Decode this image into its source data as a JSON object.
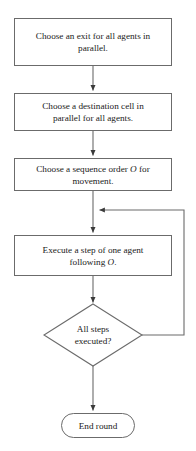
{
  "diagram": {
    "type": "flowchart",
    "colors": {
      "stroke": "#6b6b6b",
      "arrow": "#3a3a3a",
      "text": "#1a1a1a",
      "background": "#ffffff"
    },
    "nodes": [
      {
        "id": "choose-exit",
        "shape": "process",
        "line1": "Choose an exit for all agents in",
        "line2": "parallel."
      },
      {
        "id": "choose-destination",
        "shape": "process",
        "line1": "Choose a destination cell in",
        "line2": "parallel for all agents."
      },
      {
        "id": "choose-order",
        "shape": "process",
        "line1_pre": "Choose a sequence order ",
        "line1_var": "O",
        "line1_post": " for",
        "line2": "movement."
      },
      {
        "id": "execute-step",
        "shape": "process",
        "line1": "Execute a step of one agent",
        "line2_pre": "following ",
        "line2_var": "O",
        "line2_post": "."
      },
      {
        "id": "all-steps-executed",
        "shape": "decision",
        "line1": "All steps",
        "line2": "executed?"
      },
      {
        "id": "end-round",
        "shape": "terminal",
        "line1": "End round"
      }
    ],
    "edges": [
      {
        "id": "edge-exit-to-destination",
        "from": "choose-exit",
        "to": "choose-destination",
        "label": ""
      },
      {
        "id": "edge-destination-to-order",
        "from": "choose-destination",
        "to": "choose-order",
        "label": ""
      },
      {
        "id": "edge-order-to-execute",
        "from": "choose-order",
        "to": "execute-step",
        "label": ""
      },
      {
        "id": "edge-execute-to-decision",
        "from": "execute-step",
        "to": "all-steps-executed",
        "label": ""
      },
      {
        "id": "edge-decision-loopback",
        "from": "all-steps-executed",
        "to": "execute-step",
        "label": ""
      },
      {
        "id": "edge-decision-to-end",
        "from": "all-steps-executed",
        "to": "end-round",
        "label": ""
      }
    ]
  }
}
